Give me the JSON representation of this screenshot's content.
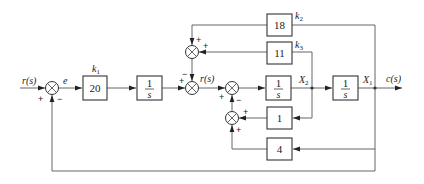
{
  "diagram": {
    "type": "control-system-block-diagram",
    "signals": {
      "input": "r(s)",
      "error": "e",
      "inner_reference": "r(s)",
      "state_x2": "X",
      "state_x2_sub": "2",
      "state_x1": "X",
      "state_x1_sub": "1",
      "output": "c(s)"
    },
    "blocks": {
      "k1": {
        "gain_label": "k",
        "gain_sub": "1",
        "value": "20"
      },
      "integrator1": {
        "num": "1",
        "den": "s"
      },
      "integrator2": {
        "num": "1",
        "den": "s"
      },
      "integrator3": {
        "num": "1",
        "den": "s"
      },
      "k2": {
        "gain_label": "k",
        "gain_sub": "2",
        "value": "18"
      },
      "k3": {
        "gain_label": "k",
        "gain_sub": "3",
        "value": "11"
      },
      "inner_fb1": {
        "value": "1"
      },
      "inner_fb4": {
        "value": "4"
      }
    },
    "summers": {
      "main": {
        "in_left": "+",
        "in_bottom": "−"
      },
      "top": {
        "in_top": "+",
        "in_right": "+"
      },
      "middle": {
        "in_left": "+",
        "in_top": "−"
      },
      "inner": {
        "in_left": "+",
        "in_bottom": "−"
      },
      "bottom": {
        "in_right": "+",
        "in_bottom": "+"
      }
    }
  }
}
